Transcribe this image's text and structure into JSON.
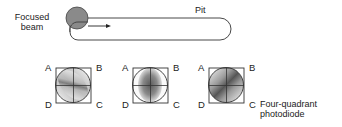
{
  "top": {
    "beam_label_line1": "Focused",
    "beam_label_line2": "beam",
    "pit_label": "Pit"
  },
  "photodiodes": [
    {
      "position": "left",
      "spot_shape": "diagonal-ellipse-AC",
      "labels": {
        "a": "A",
        "b": "B",
        "c": "C",
        "d": "D"
      }
    },
    {
      "position": "center",
      "spot_shape": "vertical-ellipse",
      "labels": {
        "a": "A",
        "b": "B",
        "c": "C",
        "d": "D"
      }
    },
    {
      "position": "right",
      "spot_shape": "diagonal-ellipse-AC",
      "labels": {
        "a": "A",
        "b": "B",
        "c": "C",
        "d": "D"
      }
    }
  ],
  "caption": {
    "line1": "Four-quadrant",
    "line2": "photodiode"
  },
  "colors": {
    "stroke": "#333333",
    "beam_fill": "#8a8a8a",
    "spot_dark": "#555555",
    "spot_light": "#f2f2f2"
  }
}
